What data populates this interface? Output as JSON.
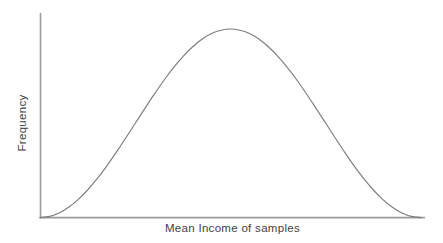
{
  "figure": {
    "background": "#ffffff"
  },
  "chart_data": {
    "type": "line",
    "title": "",
    "xlabel": "Mean Income of samples",
    "ylabel": "Frequency",
    "grid": false,
    "legend": false,
    "x_ticks": [],
    "y_ticks": [],
    "xlim": [
      0,
      1
    ],
    "ylim": [
      0,
      1.08
    ],
    "x": [
      0,
      0.025,
      0.05,
      0.075,
      0.1,
      0.125,
      0.15,
      0.175,
      0.2,
      0.225,
      0.25,
      0.275,
      0.3,
      0.325,
      0.35,
      0.375,
      0.4,
      0.425,
      0.45,
      0.475,
      0.5,
      0.525,
      0.55,
      0.575,
      0.6,
      0.625,
      0.65,
      0.675,
      0.7,
      0.725,
      0.75,
      0.775,
      0.8,
      0.825,
      0.85,
      0.875,
      0.9,
      0.925,
      0.95,
      0.975,
      1
    ],
    "y": [
      0,
      0.0062,
      0.0245,
      0.0545,
      0.0955,
      0.1464,
      0.2061,
      0.273,
      0.3455,
      0.4218,
      0.5,
      0.5782,
      0.6545,
      0.727,
      0.7939,
      0.8536,
      0.9045,
      0.9455,
      0.9755,
      0.9938,
      1,
      0.9938,
      0.9755,
      0.9455,
      0.9045,
      0.8536,
      0.7939,
      0.727,
      0.6545,
      0.5782,
      0.5,
      0.4218,
      0.3455,
      0.273,
      0.2061,
      0.1464,
      0.0955,
      0.0545,
      0.0245,
      0.0062,
      0
    ],
    "line_color": "#7d7d7d",
    "axis_color": "#9c9c9c",
    "label_color": "#3f3f3f"
  }
}
